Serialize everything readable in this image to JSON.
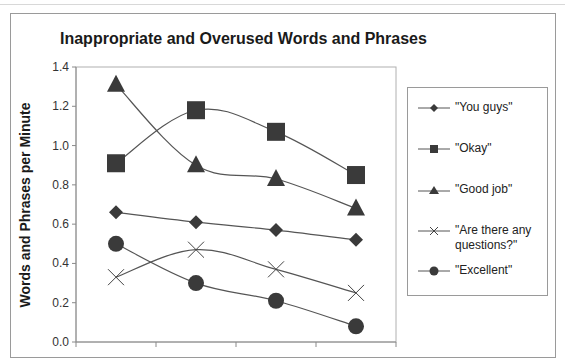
{
  "chart_data": {
    "type": "line",
    "title": "Inappropriate and Overused Words and Phrases",
    "xlabel": "",
    "ylabel": "Words and Phrases per Minute",
    "ylim": [
      0.0,
      1.4
    ],
    "yticks": [
      "0.0",
      "0.2",
      "0.4",
      "0.6",
      "0.8",
      "1.0",
      "1.2",
      "1.4"
    ],
    "categories": [
      "1",
      "2",
      "3",
      "4"
    ],
    "grid": false,
    "legend_position": "right",
    "series": [
      {
        "name": "\"You guys\"",
        "marker": "diamond",
        "values": [
          0.66,
          0.61,
          0.57,
          0.52
        ]
      },
      {
        "name": "\"Okay\"",
        "marker": "square",
        "values": [
          0.91,
          1.18,
          1.07,
          0.85
        ]
      },
      {
        "name": "\"Good job\"",
        "marker": "triangle",
        "values": [
          1.31,
          0.9,
          0.83,
          0.68
        ]
      },
      {
        "name": "\"Are there any questions?\"",
        "marker": "x",
        "values": [
          0.33,
          0.47,
          0.37,
          0.25
        ]
      },
      {
        "name": "\"Excellent\"",
        "marker": "circle",
        "values": [
          0.5,
          0.3,
          0.21,
          0.08
        ]
      }
    ]
  },
  "legend": {
    "items": [
      {
        "label": "\"You guys\"",
        "icon": "diamond-marker"
      },
      {
        "label": "\"Okay\"",
        "icon": "square-marker"
      },
      {
        "label": "\"Good job\"",
        "icon": "triangle-marker"
      },
      {
        "label": "\"Are there any questions?\"",
        "icon": "x-marker"
      },
      {
        "label": "\"Excellent\"",
        "icon": "circle-marker"
      }
    ]
  },
  "colors": {
    "marker": "#3a3a3a",
    "line": "#555555",
    "axis": "#8a8a8a",
    "border": "#9a9a9a"
  }
}
